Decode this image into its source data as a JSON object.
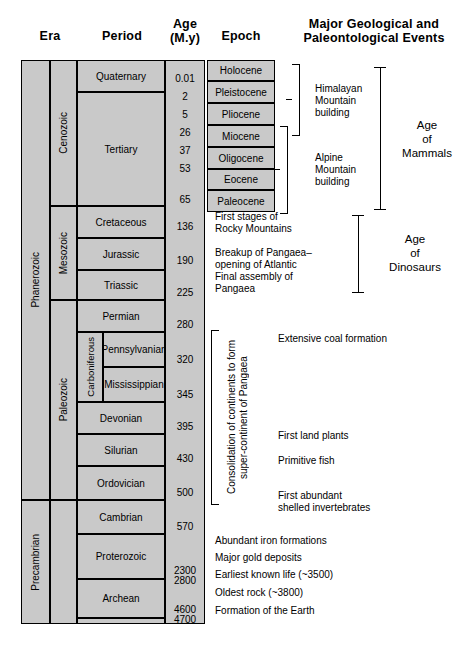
{
  "headers": {
    "era": "Era",
    "period": "Period",
    "age_line1": "Age",
    "age_line2": "(M.y)",
    "epoch": "Epoch",
    "events_line1": "Major Geological and",
    "events_line2": "Paleontological Events"
  },
  "eons": [
    {
      "label": "Phanerozoic"
    },
    {
      "label": "Precambrian"
    }
  ],
  "eras": [
    {
      "label": "Cenozoic"
    },
    {
      "label": "Mesozoic"
    },
    {
      "label": "Paleozoic"
    }
  ],
  "periods": [
    {
      "label": "Quaternary"
    },
    {
      "label": "Tertiary"
    },
    {
      "label": "Cretaceous"
    },
    {
      "label": "Jurassic"
    },
    {
      "label": "Triassic"
    },
    {
      "label": "Permian"
    },
    {
      "label": "Pennsylvanian"
    },
    {
      "label": "Mississippian"
    },
    {
      "label": "Devonian"
    },
    {
      "label": "Silurian"
    },
    {
      "label": "Ordovician"
    },
    {
      "label": "Cambrian"
    },
    {
      "label": "Proterozoic"
    },
    {
      "label": "Archean"
    }
  ],
  "subperiod": {
    "label": "Carboniferous"
  },
  "epochs": [
    {
      "label": "Holocene"
    },
    {
      "label": "Pleistocene"
    },
    {
      "label": "Pliocene"
    },
    {
      "label": "Miocene"
    },
    {
      "label": "Oligocene"
    },
    {
      "label": "Eocene"
    },
    {
      "label": "Paleocene"
    }
  ],
  "ages": [
    {
      "value": "0.01"
    },
    {
      "value": "2"
    },
    {
      "value": "5"
    },
    {
      "value": "26"
    },
    {
      "value": "37"
    },
    {
      "value": "53"
    },
    {
      "value": "65"
    },
    {
      "value": "136"
    },
    {
      "value": "190"
    },
    {
      "value": "225"
    },
    {
      "value": "280"
    },
    {
      "value": "320"
    },
    {
      "value": "345"
    },
    {
      "value": "395"
    },
    {
      "value": "430"
    },
    {
      "value": "500"
    },
    {
      "value": "570"
    },
    {
      "value": "2300"
    },
    {
      "value": "2800"
    },
    {
      "value": "4600"
    },
    {
      "value": "4700"
    }
  ],
  "events": {
    "himalayan": "Himalayan\nMountain\nbuilding",
    "alpine": "Alpine\nMountain\nbuilding",
    "rocky": "First stages of\nRocky Mountains",
    "pangaea_breakup": "Breakup of Pangaea–\nopening of Atlantic",
    "pangaea_assembly": "Final assembly of\nPangaea",
    "coal": "Extensive coal formation",
    "land_plants": "First land plants",
    "primitive_fish": "Primitive fish",
    "shelled": "First abundant\nshelled invertebrates",
    "iron": "Abundant iron formations",
    "gold": "Major gold deposits",
    "earliest_life": "Earliest known life (~3500)",
    "oldest_rock": "Oldest rock (~3800)",
    "earth_formation": "Formation of the Earth",
    "consolidation": "Consolidation of continents to form\nsuper-continent of Pangaea",
    "age_of_mammals": "Age\nof\nMammals",
    "age_of_dinosaurs": "Age\nof\nDinosaurs"
  },
  "colors": {
    "cell_fill": "#c9c9c9",
    "line": "#000000",
    "background": "#ffffff"
  }
}
